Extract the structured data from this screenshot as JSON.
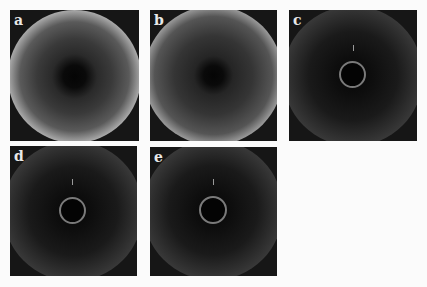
{
  "figure": {
    "type": "diffraction-pattern-panels",
    "panels": [
      {
        "label": "a",
        "style": "broad-halo"
      },
      {
        "label": "b",
        "style": "broad-halo"
      },
      {
        "label": "c",
        "style": "sharp-ring-with-inner-ring"
      },
      {
        "label": "d",
        "style": "sharp-ring-with-inner-ring"
      },
      {
        "label": "e",
        "style": "sharp-ring-with-inner-ring"
      }
    ]
  },
  "colors": {
    "background": "#fbfbfb",
    "panel": "#161616",
    "ring": "#e6e6e6"
  }
}
